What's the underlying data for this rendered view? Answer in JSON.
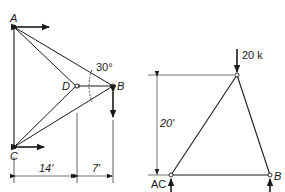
{
  "colors": {
    "ink": "#1a1a1a",
    "background": "#ffffff"
  },
  "left_diagram": {
    "description": "Truss with joints A, B, C, D; A and C on a vertical line, D and B on horizontal line",
    "joints": {
      "A": {
        "label": "A"
      },
      "B": {
        "label": "B"
      },
      "C": {
        "label": "C"
      },
      "D": {
        "label": "D"
      }
    },
    "angle_label": "30°",
    "dimensions": [
      {
        "label": "14′"
      },
      {
        "label": "7′"
      }
    ],
    "arrows": [
      {
        "name": "A-horizontal-double-arrow"
      },
      {
        "name": "C-horizontal-double-arrow"
      },
      {
        "name": "B-vertical-double-arrow"
      }
    ]
  },
  "right_diagram": {
    "description": "Triangular truss with pinned supports at AC and B and a vertical load at apex",
    "joints": {
      "AC": {
        "label": "AC"
      },
      "B": {
        "label": "B"
      }
    },
    "load": {
      "label": "20 k"
    },
    "dimensions": [
      {
        "label": "20′"
      }
    ],
    "reactions": [
      {
        "name": "reaction-AC-up"
      },
      {
        "name": "reaction-B-up"
      }
    ]
  }
}
